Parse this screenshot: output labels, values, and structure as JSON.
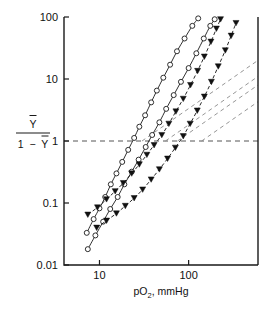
{
  "chart_data": {
    "type": "line",
    "title": "",
    "xlabel": "pO2, mmHg",
    "xlabel_main": "pO",
    "xlabel_sub": "2",
    "xlabel_tail": ", mmHg",
    "ylabel": "Y / (1 - Y)",
    "ylabel_num": "Y",
    "ylabel_den_one": "1",
    "ylabel_den_minus": "−",
    "ylabel_den_y": "Y",
    "xscale": "log",
    "yscale": "log",
    "xlim": [
      4,
      600
    ],
    "ylim": [
      0.01,
      100
    ],
    "xticks": [
      10,
      100
    ],
    "xtick_labels": [
      "10",
      "100"
    ],
    "yticks": [
      0.01,
      0.1,
      1,
      10,
      100
    ],
    "ytick_labels": [
      "0.01",
      "0.1",
      "1",
      "10",
      "100"
    ],
    "grid": false,
    "legend": "none",
    "reference_lines": [
      {
        "name": "half-saturation-line",
        "orientation": "horizontal",
        "y": 1,
        "style": "dashed",
        "color": "#555555"
      }
    ],
    "series": [
      {
        "name": "curve-1-open-circle",
        "marker": "open-circle",
        "color": "#1a1a1a",
        "linestyle": "solid",
        "points": [
          [
            7.2,
            0.033
          ],
          [
            8.6,
            0.055
          ],
          [
            10.0,
            0.082
          ],
          [
            11.6,
            0.125
          ],
          [
            13.4,
            0.2
          ],
          [
            15.5,
            0.3
          ],
          [
            18.0,
            0.46
          ],
          [
            21.0,
            0.72
          ],
          [
            24.5,
            1.12
          ],
          [
            28.0,
            1.7
          ],
          [
            32.5,
            2.6
          ],
          [
            38.0,
            4.2
          ],
          [
            44.0,
            6.5
          ],
          [
            52.0,
            10.5
          ],
          [
            62.0,
            17.0
          ],
          [
            74.0,
            28.0
          ],
          [
            90.0,
            45.0
          ],
          [
            110.0,
            72.0
          ],
          [
            128.0,
            95.0
          ]
        ]
      },
      {
        "name": "curve-2-open-circle",
        "marker": "open-circle",
        "color": "#1a1a1a",
        "linestyle": "solid",
        "points": [
          [
            7.4,
            0.018
          ],
          [
            9.0,
            0.03
          ],
          [
            11.0,
            0.05
          ],
          [
            13.2,
            0.08
          ],
          [
            16.0,
            0.125
          ],
          [
            19.0,
            0.2
          ],
          [
            23.0,
            0.32
          ],
          [
            27.5,
            0.5
          ],
          [
            33.0,
            0.8
          ],
          [
            39.0,
            1.25
          ],
          [
            47.0,
            2.0
          ],
          [
            56.0,
            3.3
          ],
          [
            68.0,
            5.5
          ],
          [
            82.0,
            9.0
          ],
          [
            100.0,
            15.0
          ],
          [
            122.0,
            26.0
          ],
          [
            148.0,
            45.0
          ],
          [
            175.0,
            72.0
          ],
          [
            196.0,
            92.0
          ]
        ]
      },
      {
        "name": "curve-3-filled-triangle",
        "marker": "filled-triangle-down",
        "color": "#111111",
        "linestyle": "dashed",
        "points": [
          [
            7.4,
            0.065
          ],
          [
            9.5,
            0.085
          ],
          [
            12.0,
            0.115
          ],
          [
            15.0,
            0.155
          ],
          [
            18.5,
            0.21
          ],
          [
            23.0,
            0.3
          ],
          [
            28.0,
            0.42
          ],
          [
            34.0,
            0.6
          ],
          [
            41.0,
            0.86
          ],
          [
            50.0,
            1.25
          ],
          [
            60.0,
            1.9
          ],
          [
            72.0,
            3.0
          ],
          [
            87.0,
            4.8
          ],
          [
            105.0,
            8.0
          ],
          [
            126.0,
            13.5
          ],
          [
            150.0,
            23.0
          ],
          [
            178.0,
            40.0
          ],
          [
            205.0,
            65.0
          ],
          [
            228.0,
            92.0
          ]
        ]
      },
      {
        "name": "curve-4-filled-triangle",
        "marker": "filled-triangle-down",
        "color": "#111111",
        "linestyle": "dashed",
        "points": [
          [
            9.3,
            0.04
          ],
          [
            12.0,
            0.052
          ],
          [
            15.5,
            0.068
          ],
          [
            19.5,
            0.09
          ],
          [
            24.5,
            0.12
          ],
          [
            30.5,
            0.165
          ],
          [
            38.0,
            0.24
          ],
          [
            47.0,
            0.35
          ],
          [
            58.0,
            0.52
          ],
          [
            71.0,
            0.78
          ],
          [
            87.0,
            1.2
          ],
          [
            104.0,
            1.9
          ],
          [
            125.0,
            3.1
          ],
          [
            150.0,
            5.2
          ],
          [
            180.0,
            9.0
          ],
          [
            215.0,
            16.0
          ],
          [
            258.0,
            29.0
          ],
          [
            300.0,
            50.0
          ],
          [
            340.0,
            80.0
          ]
        ]
      }
    ],
    "asymptotes": [
      {
        "name": "asymptote-low-1",
        "x1": 30,
        "y1": 1.0,
        "x2": 600,
        "y2": 20.0,
        "style": "dashed"
      },
      {
        "name": "asymptote-low-2",
        "x1": 55,
        "y1": 1.0,
        "x2": 600,
        "y2": 11.0,
        "style": "dashed"
      },
      {
        "name": "asymptote-low-3",
        "x1": 75,
        "y1": 1.0,
        "x2": 600,
        "y2": 8.0,
        "style": "dashed"
      },
      {
        "name": "asymptote-low-4",
        "x1": 140,
        "y1": 1.0,
        "x2": 600,
        "y2": 4.3,
        "style": "dashed"
      }
    ]
  }
}
